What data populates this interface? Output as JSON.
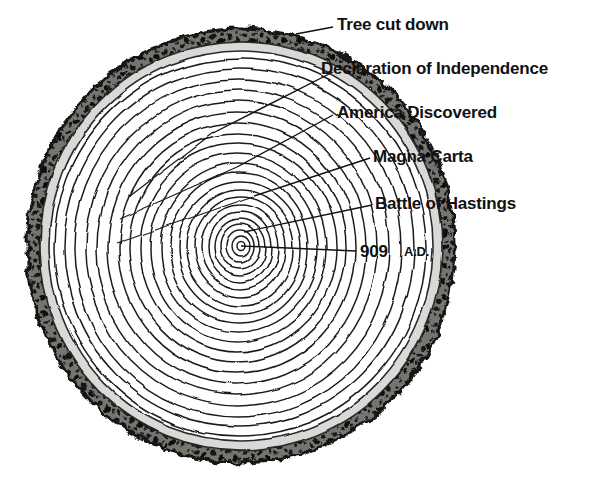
{
  "figure": {
    "background_color": "#ffffff",
    "ink_color": "#111111",
    "bark_color": "#4a4a4a",
    "bark_speck_color": "#1a1a1a",
    "sapwood_color": "#d8d8d6",
    "heartwood_color": "#ffffff",
    "ring_color": "#222222"
  },
  "annotations": {
    "tree_cut_down": "Tree cut down",
    "declaration": "Declaration of Independence",
    "america_discovered": "America Discovered",
    "magna_carta": "Magna Carta",
    "battle_of_hastings": "Battle of Hastings",
    "year": "909",
    "era": "A.D."
  },
  "leader_lines": [
    {
      "name": "tree-cut-down-leader",
      "x1": 333,
      "y1": 27,
      "x2": 296,
      "y2": 34
    },
    {
      "name": "declaration-leader",
      "x1": 333,
      "y1": 72,
      "x2": 213,
      "y2": 133
    },
    {
      "name": "america-leader",
      "x1": 333,
      "y1": 115,
      "x2": 237,
      "y2": 167
    },
    {
      "name": "magna-carta-leader",
      "x1": 370,
      "y1": 158,
      "x2": 254,
      "y2": 196
    },
    {
      "name": "battle-leader",
      "x1": 372,
      "y1": 205,
      "x2": 244,
      "y2": 232
    },
    {
      "name": "year-leader",
      "x1": 356,
      "y1": 251,
      "x2": 241,
      "y2": 246
    }
  ],
  "trunk": {
    "center_x": 241,
    "center_y": 246,
    "ring_count": 22,
    "outer_radius_x": 216,
    "outer_radius_y": 219
  }
}
